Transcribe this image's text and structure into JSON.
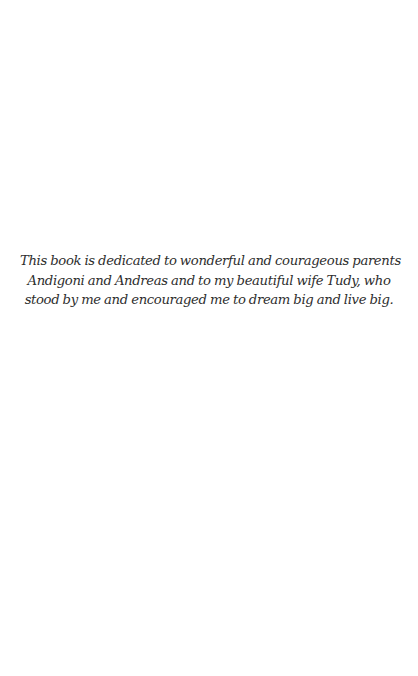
{
  "page": {
    "type": "dedication",
    "text_color": "#2e2e2e",
    "background": "#ffffff"
  },
  "dedication": {
    "lines": [
      "This book is dedicated to wonderful and courageous parents",
      "Andigoni and Andreas and to my beautiful wife Tudy, who",
      "stood by me and encouraged me to dream big and live big."
    ]
  }
}
